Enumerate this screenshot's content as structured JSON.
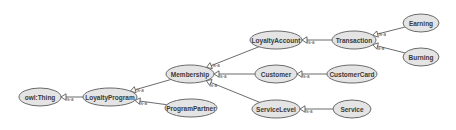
{
  "diagram": {
    "type": "ontology-class-hierarchy",
    "relation_label": "is-a",
    "colors": {
      "node_fill": "#e4e4e4",
      "node_stroke": "#6a6a6a",
      "edge": "#5a5a5a",
      "text": "#3a3a3a",
      "background": "#ffffff"
    },
    "nodes": [
      {
        "id": "owlThing",
        "label": "owl:Thing",
        "cx": 40,
        "cy": 97,
        "rx": 21,
        "ry": 9
      },
      {
        "id": "LoyaltyProgram",
        "label": "LoyaltyProgram",
        "cx": 110,
        "cy": 97,
        "rx": 27,
        "ry": 9
      },
      {
        "id": "Membership",
        "label": "Membership",
        "cx": 190,
        "cy": 74,
        "rx": 24,
        "ry": 9
      },
      {
        "id": "ProgramPartner",
        "label": "ProgramPartner",
        "cx": 191,
        "cy": 108,
        "rx": 26,
        "ry": 9
      },
      {
        "id": "LoyaltyAccount",
        "label": "LoyaltyAccount",
        "cx": 276,
        "cy": 40,
        "rx": 26,
        "ry": 9
      },
      {
        "id": "Customer",
        "label": "Customer",
        "cx": 276,
        "cy": 74,
        "rx": 21,
        "ry": 9
      },
      {
        "id": "ServiceLevel",
        "label": "ServiceLevel",
        "cx": 276,
        "cy": 109,
        "rx": 24,
        "ry": 9
      },
      {
        "id": "Transaction",
        "label": "Transaction",
        "cx": 354,
        "cy": 40,
        "rx": 22,
        "ry": 9
      },
      {
        "id": "CustomerCard",
        "label": "CustomerCard",
        "cx": 352,
        "cy": 74,
        "rx": 25,
        "ry": 9
      },
      {
        "id": "Service",
        "label": "Service",
        "cx": 352,
        "cy": 109,
        "rx": 19,
        "ry": 9
      },
      {
        "id": "Earning",
        "label": "Earning",
        "cx": 421,
        "cy": 23,
        "rx": 18,
        "ry": 9
      },
      {
        "id": "Burning",
        "label": "Burning",
        "cx": 421,
        "cy": 57,
        "rx": 18,
        "ry": 9
      }
    ],
    "edges": [
      {
        "from": "LoyaltyProgram",
        "to": "owlThing",
        "label": "is-a"
      },
      {
        "from": "Membership",
        "to": "LoyaltyProgram",
        "label": "is-a"
      },
      {
        "from": "ProgramPartner",
        "to": "LoyaltyProgram",
        "label": "is-a"
      },
      {
        "from": "LoyaltyAccount",
        "to": "Membership",
        "label": "is-a"
      },
      {
        "from": "Customer",
        "to": "Membership",
        "label": "is-a"
      },
      {
        "from": "ServiceLevel",
        "to": "Membership",
        "label": "is-a"
      },
      {
        "from": "Transaction",
        "to": "LoyaltyAccount",
        "label": "is-a"
      },
      {
        "from": "CustomerCard",
        "to": "Customer",
        "label": "is-a"
      },
      {
        "from": "Service",
        "to": "ServiceLevel",
        "label": "is-a"
      },
      {
        "from": "Earning",
        "to": "Transaction",
        "label": "is-a"
      },
      {
        "from": "Burning",
        "to": "Transaction",
        "label": "is-a"
      }
    ]
  }
}
